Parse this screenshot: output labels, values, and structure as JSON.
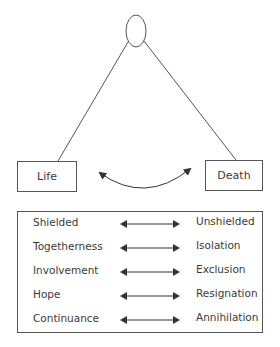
{
  "diagram": {
    "top_node": {
      "shape": "ellipse"
    },
    "left_node": {
      "label": "Life"
    },
    "right_node": {
      "label": "Death"
    },
    "connector": "curved-double-arrow"
  },
  "pairs": [
    {
      "left": "Shielded",
      "right": "Unshielded"
    },
    {
      "left": "Togetherness",
      "right": "Isolation"
    },
    {
      "left": "Involvement",
      "right": "Exclusion"
    },
    {
      "left": "Hope",
      "right": "Resignation"
    },
    {
      "left": "Continuance",
      "right": "Annihilation"
    }
  ],
  "colors": {
    "line": "#555555",
    "text": "#3a3a3a",
    "background": "#ffffff"
  }
}
